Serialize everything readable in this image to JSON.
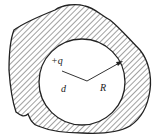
{
  "diagram": {
    "labels": {
      "charge": "+q",
      "distance": "d",
      "radius": "R"
    },
    "colors": {
      "stroke": "#222222",
      "hatch": "#444444",
      "background": "#ffffff"
    }
  }
}
